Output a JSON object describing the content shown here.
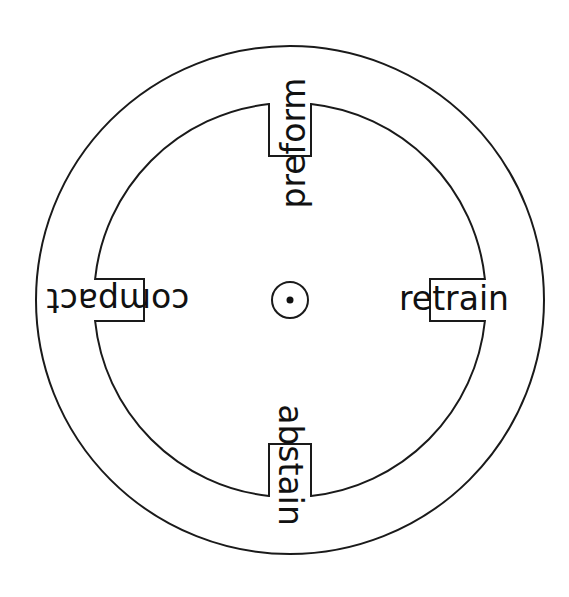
{
  "diagram": {
    "type": "word-wheel",
    "center_mark": "dot-in-circle",
    "words": {
      "top": "preform",
      "right": "retrain",
      "bottom": "abstain",
      "left": "compact"
    },
    "boxed_segments": {
      "top": "form",
      "right": "train",
      "bottom": "stain",
      "left": "pact"
    },
    "colors": {
      "stroke": "#1a1a1a",
      "text": "#111111",
      "background": "#ffffff"
    }
  }
}
